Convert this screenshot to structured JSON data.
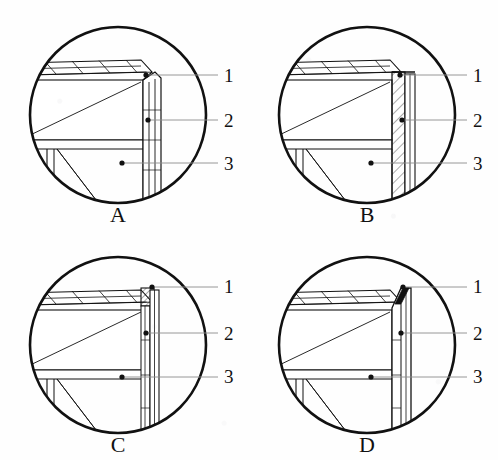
{
  "figure": {
    "type": "technical-detail-drawing",
    "background_color": "#fefefe",
    "line_color": "#111111",
    "panel_count": 4,
    "callout_labels": [
      "1",
      "2",
      "3"
    ],
    "panels": [
      {
        "id": "A",
        "letter": "A",
        "center": {
          "x": 118,
          "y": 115
        },
        "radius": 90,
        "callouts": [
          {
            "label": "1",
            "text_x": 228,
            "text_y": 82,
            "line_y": 75,
            "dot_x": 146,
            "dot_y": 75
          },
          {
            "label": "2",
            "text_x": 228,
            "text_y": 127,
            "line_y": 120,
            "dot_x": 148,
            "dot_y": 120
          },
          {
            "label": "3",
            "text_x": 228,
            "text_y": 170,
            "line_y": 163,
            "dot_x": 122,
            "dot_y": 163
          }
        ],
        "edge_style": "chamfered-corner-open-jamb",
        "jamb_hatched": false,
        "corner_block_hatched": false
      },
      {
        "id": "B",
        "letter": "B",
        "center": {
          "x": 367,
          "y": 115
        },
        "radius": 90,
        "callouts": [
          {
            "label": "1",
            "text_x": 477,
            "text_y": 82,
            "line_y": 75,
            "dot_x": 400,
            "dot_y": 75
          },
          {
            "label": "2",
            "text_x": 477,
            "text_y": 127,
            "line_y": 120,
            "dot_x": 402,
            "dot_y": 120
          },
          {
            "label": "3",
            "text_x": 477,
            "text_y": 170,
            "line_y": 163,
            "dot_x": 371,
            "dot_y": 163
          }
        ],
        "edge_style": "square-corner-hatched-jamb",
        "jamb_hatched": true,
        "corner_block_hatched": false
      },
      {
        "id": "C",
        "letter": "C",
        "center": {
          "x": 118,
          "y": 345
        },
        "radius": 90,
        "callouts": [
          {
            "label": "1",
            "text_x": 228,
            "text_y": 293,
            "line_y": 287,
            "dot_x": 152,
            "dot_y": 287
          },
          {
            "label": "2",
            "text_x": 228,
            "text_y": 340,
            "line_y": 333,
            "dot_x": 146,
            "dot_y": 333
          },
          {
            "label": "3",
            "text_x": 228,
            "text_y": 383,
            "line_y": 377,
            "dot_x": 122,
            "dot_y": 377
          }
        ],
        "edge_style": "hatched-corner-block-jamb",
        "jamb_hatched": false,
        "corner_block_hatched": true
      },
      {
        "id": "D",
        "letter": "D",
        "center": {
          "x": 367,
          "y": 345
        },
        "radius": 90,
        "callouts": [
          {
            "label": "1",
            "text_x": 477,
            "text_y": 293,
            "line_y": 287,
            "dot_x": 403,
            "dot_y": 287
          },
          {
            "label": "2",
            "text_x": 477,
            "text_y": 340,
            "line_y": 333,
            "dot_x": 401,
            "dot_y": 333
          },
          {
            "label": "3",
            "text_x": 477,
            "text_y": 383,
            "line_y": 377,
            "dot_x": 371,
            "dot_y": 377
          }
        ],
        "edge_style": "solid-filled-corner-jamb",
        "jamb_hatched": false,
        "corner_block_hatched": false
      }
    ]
  }
}
